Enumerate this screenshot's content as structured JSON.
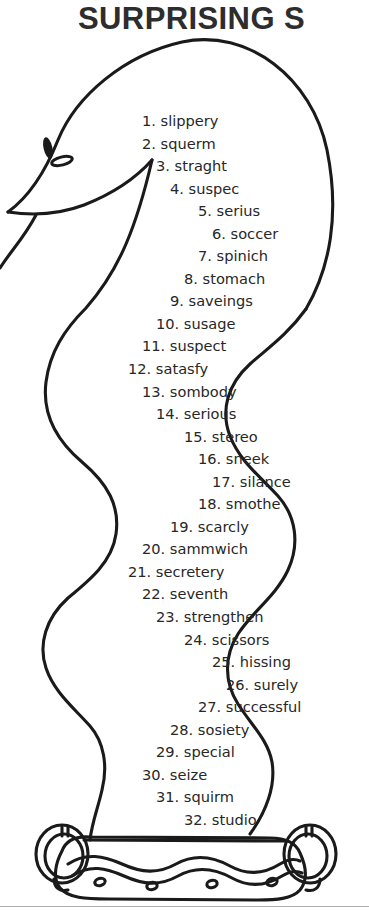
{
  "title": "SURPRISING S",
  "colors": {
    "ink": "#272727",
    "title_ink": "#2d2d2d",
    "outline": "#1a1a1a",
    "paper": "#ffffff",
    "rule": "#aeaeae"
  },
  "artwork": {
    "subject": "snake-coiled-in-basket",
    "parts": [
      "snake-head",
      "snake-eye",
      "snake-nostril",
      "snake-tongue",
      "snake-body",
      "basket",
      "basket-handle-left",
      "basket-handle-right",
      "basket-wave-band",
      "basket-dots"
    ]
  },
  "word_list": {
    "indent_unit_px": 14,
    "items": [
      {
        "num": "1.",
        "word": "slippery",
        "indent": 3
      },
      {
        "num": "2.",
        "word": "squerm",
        "indent": 3
      },
      {
        "num": "3.",
        "word": "straght",
        "indent": 4
      },
      {
        "num": "4.",
        "word": "suspec",
        "indent": 5
      },
      {
        "num": "5.",
        "word": "serius",
        "indent": 7
      },
      {
        "num": "6.",
        "word": "soccer",
        "indent": 8
      },
      {
        "num": "7.",
        "word": "spinich",
        "indent": 7
      },
      {
        "num": "8.",
        "word": "stomach",
        "indent": 6
      },
      {
        "num": "9.",
        "word": "saveings",
        "indent": 5
      },
      {
        "num": "10.",
        "word": "susage",
        "indent": 4
      },
      {
        "num": "11.",
        "word": "suspect",
        "indent": 3
      },
      {
        "num": "12.",
        "word": "satasfy",
        "indent": 2
      },
      {
        "num": "13.",
        "word": "sombody",
        "indent": 3
      },
      {
        "num": "14.",
        "word": "serious",
        "indent": 4
      },
      {
        "num": "15.",
        "word": "stereo",
        "indent": 6
      },
      {
        "num": "16.",
        "word": "sneek",
        "indent": 7
      },
      {
        "num": "17.",
        "word": "silance",
        "indent": 8
      },
      {
        "num": "18.",
        "word": "smothe",
        "indent": 7
      },
      {
        "num": "19.",
        "word": "scarcly",
        "indent": 5
      },
      {
        "num": "20.",
        "word": "sammwich",
        "indent": 3
      },
      {
        "num": "21.",
        "word": "secretery",
        "indent": 2
      },
      {
        "num": "22.",
        "word": "seventh",
        "indent": 3
      },
      {
        "num": "23.",
        "word": "strengthen",
        "indent": 4
      },
      {
        "num": "24.",
        "word": "scissors",
        "indent": 6
      },
      {
        "num": "25.",
        "word": "hissing",
        "indent": 8
      },
      {
        "num": "26.",
        "word": "surely",
        "indent": 9
      },
      {
        "num": "27.",
        "word": "successful",
        "indent": 7
      },
      {
        "num": "28.",
        "word": "sosiety",
        "indent": 5
      },
      {
        "num": "29.",
        "word": "special",
        "indent": 4
      },
      {
        "num": "30.",
        "word": "seize",
        "indent": 3
      },
      {
        "num": "31.",
        "word": "squirm",
        "indent": 4
      },
      {
        "num": "32.",
        "word": "studio",
        "indent": 6
      }
    ]
  }
}
